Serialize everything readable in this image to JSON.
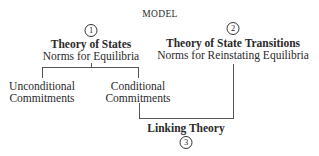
{
  "title": "MODEL",
  "nodes": {
    "states": {
      "number": "1",
      "title": "Theory of States",
      "subtitle": "Norms for Equilibria"
    },
    "transitions": {
      "number": "2",
      "title": "Theory of State Transitions",
      "subtitle": "Norms for Reinstating Equilibria"
    },
    "unconditional": {
      "line1": "Unconditional",
      "line2": "Commitments"
    },
    "conditional": {
      "line1": "Conditional",
      "line2": "Commitments"
    },
    "linking": {
      "number": "3",
      "title": "Linking Theory"
    }
  }
}
